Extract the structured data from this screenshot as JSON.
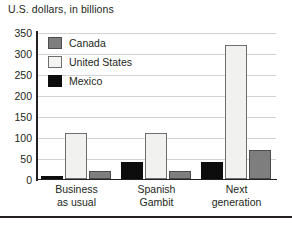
{
  "chart_data": {
    "type": "bar",
    "title": "U.S. dollars, in billions",
    "xlabel": "",
    "ylabel": "",
    "ylim": [
      0,
      350
    ],
    "yticks": [
      0,
      50,
      100,
      150,
      200,
      250,
      300,
      350
    ],
    "ytick_labels": [
      "0",
      "50",
      "100",
      "150",
      "200",
      "250",
      "300",
      "350"
    ],
    "grid": true,
    "legend_position": "top-left",
    "categories": [
      "Business as usual",
      "Spanish Gambit",
      "Next generation"
    ],
    "category_lines": [
      [
        "Business",
        "as usual"
      ],
      [
        "Spanish",
        "Gambit"
      ],
      [
        "Next",
        "generation"
      ]
    ],
    "bar_order": [
      "Mexico",
      "United States",
      "Canada"
    ],
    "series": [
      {
        "name": "Canada",
        "color": "#7e7e7e",
        "values": [
          18,
          18,
          70
        ]
      },
      {
        "name": "United States",
        "color": "#f1f1ef",
        "values": [
          110,
          110,
          320
        ]
      },
      {
        "name": "Mexico",
        "color": "#0d0d0d",
        "values": [
          8,
          40,
          40
        ]
      }
    ]
  },
  "legend": {
    "items": [
      {
        "label": "Canada",
        "swatch": "canada-swatch"
      },
      {
        "label": "United States",
        "swatch": "united-states-swatch"
      },
      {
        "label": "Mexico",
        "swatch": "mexico-swatch"
      }
    ]
  }
}
